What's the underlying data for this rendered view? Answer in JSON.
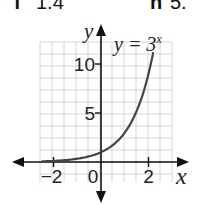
{
  "header": {
    "left_label": "f",
    "left_value": "1.4",
    "right_label": "h",
    "right_value": "5."
  },
  "chart_data": {
    "type": "line",
    "title": "",
    "function": "y = 3^x",
    "annotation": {
      "text": "y = 3",
      "superscript": "x"
    },
    "xlabel": "x",
    "ylabel": "y",
    "x_ticks": [
      -2,
      0,
      2
    ],
    "y_ticks": [
      5,
      10
    ],
    "xlim": [
      -2.5,
      3
    ],
    "ylim": [
      -2,
      12
    ],
    "grid": true,
    "series": [
      {
        "name": "y = 3^x",
        "x": [
          -2.5,
          -2,
          -1.5,
          -1,
          -0.5,
          0,
          0.5,
          1,
          1.5,
          2,
          2.2
        ],
        "y": [
          0.06,
          0.11,
          0.19,
          0.33,
          0.58,
          1,
          1.73,
          3,
          5.2,
          9,
          11.2
        ]
      }
    ]
  }
}
